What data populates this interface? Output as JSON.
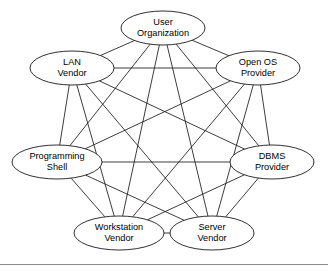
{
  "figure": {
    "type": "graph-diagram",
    "title": "",
    "background_color": "#ffffff",
    "line_color": "#1a1a1a",
    "node_fill_color": "#ffffff",
    "rule_color": "#8c8c8c"
  },
  "graph": {
    "kind": "complete-graph",
    "node_count": 8,
    "edge_count": 28,
    "nodes": [
      {
        "id": "user-organization",
        "lines": [
          "User",
          "Organization"
        ],
        "cx": 163,
        "cy": 28,
        "rx": 42,
        "ry": 17
      },
      {
        "id": "open-os-provider",
        "lines": [
          "Open OS",
          "Provider"
        ],
        "cx": 258,
        "cy": 68,
        "rx": 42,
        "ry": 17
      },
      {
        "id": "dbms-provider",
        "lines": [
          "DBMS",
          "Provider"
        ],
        "cx": 272,
        "cy": 162,
        "rx": 42,
        "ry": 17
      },
      {
        "id": "server-vendor",
        "lines": [
          "Server",
          "Vendor"
        ],
        "cx": 212,
        "cy": 233,
        "rx": 42,
        "ry": 17
      },
      {
        "id": "workstation-vendor",
        "lines": [
          "Workstation",
          "Vendor"
        ],
        "cx": 119,
        "cy": 233,
        "rx": 45,
        "ry": 17
      },
      {
        "id": "programming-shell",
        "lines": [
          "Programming",
          "Shell"
        ],
        "cx": 57,
        "cy": 162,
        "rx": 45,
        "ry": 17
      },
      {
        "id": "lan-vendor",
        "lines": [
          "LAN",
          "Vendor"
        ],
        "cx": 72,
        "cy": 68,
        "rx": 42,
        "ry": 17
      },
      {
        "id": "open-os-anchor",
        "lines": [],
        "cx": 0,
        "cy": 0,
        "rx": 0,
        "ry": 0
      }
    ],
    "node_order": [
      "user-organization",
      "open-os-provider",
      "dbms-provider",
      "server-vendor",
      "workstation-vendor",
      "programming-shell",
      "lan-vendor"
    ],
    "labels": [
      "User Organization",
      "Open OS Provider",
      "DBMS Provider",
      "Server Vendor",
      "Workstation Vendor",
      "Programming Shell",
      "LAN Vendor"
    ]
  },
  "footer": {
    "rule_y": 264
  }
}
